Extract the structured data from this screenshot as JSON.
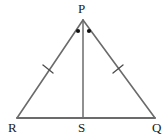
{
  "figure": {
    "name": "isosceles-triangle-with-altitude",
    "background_color": "#ffffff",
    "stroke_color": "#6b6b6b",
    "mark_color": "#1a1a1a",
    "labels": {
      "apex": "P",
      "base_left": "R",
      "base_mid": "S",
      "base_right": "Q"
    },
    "points": {
      "P": {
        "x": 83,
        "y": 20
      },
      "R": {
        "x": 17,
        "y": 118
      },
      "S": {
        "x": 83,
        "y": 118
      },
      "Q": {
        "x": 155,
        "y": 118
      }
    },
    "segments": [
      {
        "name": "side-PR",
        "from": "P",
        "to": "R"
      },
      {
        "name": "side-PQ",
        "from": "P",
        "to": "Q"
      },
      {
        "name": "base-RQ",
        "from": "R",
        "to": "Q"
      },
      {
        "name": "altitude-PS",
        "from": "P",
        "to": "S"
      }
    ],
    "congruence_ticks": [
      {
        "name": "tick-PR",
        "on": "side-PR",
        "count": 1,
        "x": 48,
        "y": 69
      },
      {
        "name": "tick-PQ",
        "on": "side-PQ",
        "count": 1,
        "x": 118,
        "y": 69
      }
    ],
    "angle_dots": [
      {
        "name": "angle-dot-RPS",
        "x": 78,
        "y": 31
      },
      {
        "name": "angle-dot-SPQ",
        "x": 89,
        "y": 31
      }
    ]
  }
}
